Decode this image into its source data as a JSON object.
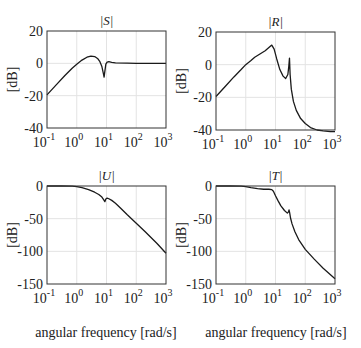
{
  "chart_data": [
    {
      "type": "line",
      "title": "|S|",
      "xlabel": "",
      "ylabel": "[dB]",
      "xscale": "log",
      "xlim": [
        0.1,
        1000
      ],
      "ylim": [
        -40,
        20
      ],
      "xticks": [
        "10^-1",
        "10^0",
        "10^1",
        "10^2",
        "10^3"
      ],
      "yticks": [
        20,
        0,
        -20,
        -40
      ],
      "grid": true,
      "box": {
        "x0": 47,
        "y0": 31,
        "x1": 166,
        "y1": 128
      },
      "series": [
        {
          "name": "|S|",
          "x": [
            0.1,
            0.2,
            0.4,
            0.7,
            1.0,
            1.5,
            2.2,
            3.0,
            4.0,
            5.0,
            6.0,
            7.0,
            7.8,
            8.3,
            8.8,
            9.5,
            10.5,
            12,
            15,
            20,
            50,
            100,
            300,
            1000
          ],
          "y": [
            -19.5,
            -13.5,
            -7.5,
            -3.0,
            -0.5,
            2.0,
            3.8,
            4.5,
            4.2,
            3.0,
            1.0,
            -2.0,
            -6.0,
            -8.5,
            -5.0,
            -0.5,
            0.8,
            1.0,
            0.6,
            0.3,
            0.1,
            0.0,
            0.0,
            0.0
          ]
        }
      ]
    },
    {
      "type": "line",
      "title": "|R|",
      "xlabel": "",
      "ylabel": "[dB]",
      "xscale": "log",
      "xlim": [
        0.1,
        1000
      ],
      "ylim": [
        -40,
        20
      ],
      "xticks": [
        "10^-1",
        "10^0",
        "10^1",
        "10^2",
        "10^3"
      ],
      "yticks": [
        20,
        0,
        -20,
        -40
      ],
      "grid": true,
      "box": {
        "x0": 216,
        "y0": 32,
        "x1": 335,
        "y1": 130
      },
      "series": [
        {
          "name": "|R|",
          "x": [
            0.1,
            0.2,
            0.4,
            0.7,
            1.0,
            1.5,
            2.0,
            3.0,
            4.5,
            6.0,
            7.5,
            9.0,
            11,
            14,
            18,
            22,
            26,
            28,
            29.5,
            31,
            34,
            40,
            50,
            70,
            100,
            150,
            250,
            400,
            700,
            1000
          ],
          "y": [
            -19.5,
            -13.5,
            -7.5,
            -3.0,
            0.0,
            2.5,
            4.5,
            6.5,
            8.5,
            10.5,
            12.0,
            9.5,
            3.5,
            -3.0,
            -7.0,
            -8.5,
            -6.0,
            -1.0,
            4.0,
            -6.0,
            -15.0,
            -22.5,
            -28.0,
            -33.0,
            -36.0,
            -38.5,
            -40.0,
            -40.5,
            -41.0,
            -41.0
          ]
        }
      ]
    },
    {
      "type": "line",
      "title": "|U|",
      "xlabel": "angular frequency [rad/s]",
      "ylabel": "[dB]",
      "xscale": "log",
      "xlim": [
        0.1,
        1000
      ],
      "ylim": [
        -150,
        0
      ],
      "xticks": [
        "10^-1",
        "10^0",
        "10^1",
        "10^2",
        "10^3"
      ],
      "yticks": [
        0,
        -50,
        -100,
        -150
      ],
      "grid": true,
      "box": {
        "x0": 47,
        "y0": 186,
        "x1": 166,
        "y1": 284
      },
      "series": [
        {
          "name": "|U|",
          "x": [
            0.1,
            0.3,
            0.7,
            1.0,
            1.5,
            2.5,
            4.0,
            5.5,
            7.0,
            8.0,
            8.8,
            9.5,
            10.5,
            12,
            15,
            20,
            30,
            50,
            100,
            200,
            500,
            1000
          ],
          "y": [
            0.0,
            0.0,
            -0.3,
            -1.0,
            -2.5,
            -5.5,
            -9.5,
            -13.0,
            -17.0,
            -21.0,
            -24.0,
            -20.0,
            -18.5,
            -19.5,
            -22.0,
            -26.5,
            -34.0,
            -44.0,
            -57.0,
            -70.0,
            -88.0,
            -103.0
          ]
        }
      ]
    },
    {
      "type": "line",
      "title": "|T|",
      "xlabel": "angular frequency [rad/s]",
      "ylabel": "[dB]",
      "xscale": "log",
      "xlim": [
        0.1,
        1000
      ],
      "ylim": [
        -150,
        0
      ],
      "xticks": [
        "10^-1",
        "10^0",
        "10^1",
        "10^2",
        "10^3"
      ],
      "yticks": [
        0,
        -50,
        -100,
        -150
      ],
      "grid": true,
      "box": {
        "x0": 216,
        "y0": 186,
        "x1": 335,
        "y1": 284
      },
      "series": [
        {
          "name": "|T|",
          "x": [
            0.1,
            0.3,
            0.7,
            1.0,
            1.5,
            2.5,
            4.0,
            6.0,
            7.5,
            8.5,
            10,
            12,
            15,
            20,
            25,
            27,
            28.5,
            30,
            32,
            36,
            45,
            60,
            100,
            200,
            400,
            1000
          ],
          "y": [
            0.0,
            0.0,
            -0.3,
            -1.0,
            -2.5,
            -4.0,
            -5.0,
            -5.0,
            -5.5,
            -8.0,
            -15.0,
            -22.0,
            -30.0,
            -37.5,
            -41.5,
            -40.0,
            -36.5,
            -41.0,
            -49.0,
            -58.0,
            -70.0,
            -82.0,
            -97.0,
            -112.0,
            -126.0,
            -142.0
          ]
        }
      ]
    }
  ],
  "axis_labels": {
    "xlabel_left": "angular frequency [rad/s]",
    "xlabel_right": "angular frequency [rad/s]",
    "ylabel": "[dB]"
  }
}
